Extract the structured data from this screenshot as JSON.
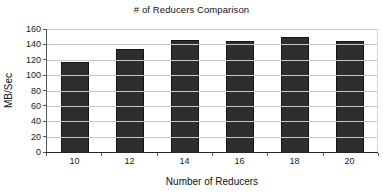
{
  "chart_data": {
    "type": "bar",
    "title": "# of Reducers Comparison",
    "categories": [
      "10",
      "12",
      "14",
      "16",
      "18",
      "20"
    ],
    "values": [
      117,
      134,
      146,
      145,
      149,
      145
    ],
    "xlabel": "Number of Reducers",
    "ylabel": "MB/Sec",
    "ylim": [
      0,
      160
    ],
    "ytick_step": 20,
    "yticks": [
      0,
      20,
      40,
      60,
      80,
      100,
      120,
      140,
      160
    ],
    "grid": true,
    "legend": "none",
    "colors": {
      "bar": "#2e2e2e",
      "bar_border": "#141414",
      "gridline": "#c6c6c6",
      "axis": "#595959",
      "baseline": "#262626",
      "background": "#ffffff",
      "text": "#1a1a1a"
    }
  }
}
